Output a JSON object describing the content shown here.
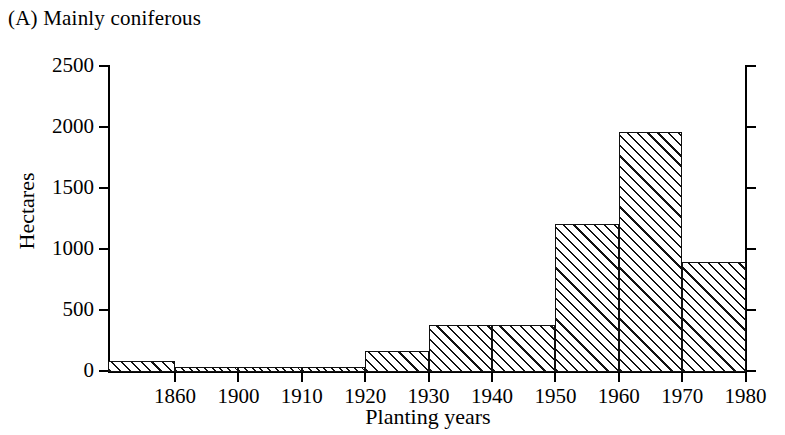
{
  "panel": {
    "label": "(A) Mainly coniferous"
  },
  "chart_data": {
    "type": "bar",
    "title": "(A) Mainly coniferous",
    "xlabel": "Planting years",
    "ylabel": "Hectares",
    "ylim": [
      0,
      2500
    ],
    "yticks": [
      0,
      500,
      1000,
      1500,
      2000,
      2500
    ],
    "ytick_labels": [
      "0",
      "500",
      "1000",
      "1500",
      "2000",
      "2500"
    ],
    "xtick_labels": [
      "1860",
      "1900",
      "1910",
      "1920",
      "1930",
      "1940",
      "1950",
      "1960",
      "1970",
      "1980"
    ],
    "grid": false,
    "legend": null,
    "bars": [
      {
        "label": "pre-1860",
        "left_edge": "start",
        "right_edge": "1860",
        "value": 85
      },
      {
        "label": "1860-1900",
        "left_edge": "1860",
        "right_edge": "1900",
        "value": 30
      },
      {
        "label": "1900-1910",
        "left_edge": "1900",
        "right_edge": "1910",
        "value": 30
      },
      {
        "label": "1910-1920",
        "left_edge": "1910",
        "right_edge": "1920",
        "value": 30
      },
      {
        "label": "1920-1930",
        "left_edge": "1920",
        "right_edge": "1930",
        "value": 165
      },
      {
        "label": "1930-1940",
        "left_edge": "1930",
        "right_edge": "1940",
        "value": 375
      },
      {
        "label": "1940-1950",
        "left_edge": "1940",
        "right_edge": "1950",
        "value": 380
      },
      {
        "label": "1950-1960",
        "left_edge": "1950",
        "right_edge": "1960",
        "value": 1205
      },
      {
        "label": "1960-1970",
        "left_edge": "1960",
        "right_edge": "1970",
        "value": 1955
      },
      {
        "label": "1970-1980",
        "left_edge": "1970",
        "right_edge": "1980",
        "value": 895
      }
    ],
    "categories": [
      "pre-1860",
      "1860-1900",
      "1900-1910",
      "1910-1920",
      "1920-1930",
      "1930-1940",
      "1940-1950",
      "1950-1960",
      "1960-1970",
      "1970-1980"
    ],
    "values": [
      85,
      30,
      30,
      30,
      165,
      375,
      380,
      1205,
      1955,
      895
    ]
  },
  "style": {
    "line_color": "#111111",
    "fill_color": "#ffffff",
    "background": "#ffffff",
    "hatch": "forward-diagonal"
  }
}
